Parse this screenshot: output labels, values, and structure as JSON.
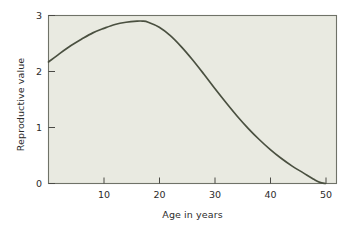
{
  "figure": {
    "page_background": "#ffffff",
    "plot_background": "#e9eae1",
    "frame_color": "#6f7268",
    "text_color": "#2b2b2b",
    "curve_color": "#4a5040"
  },
  "chart_data": {
    "type": "line",
    "title": "",
    "xlabel": "Age in years",
    "ylabel": "Reproductive value",
    "xlim": [
      0,
      52
    ],
    "ylim": [
      0,
      3
    ],
    "grid": false,
    "legend": null,
    "xticks": [
      10,
      20,
      30,
      40,
      50
    ],
    "xtick_labels": [
      "10",
      "20",
      "30",
      "40",
      "50"
    ],
    "yticks": [
      0,
      1,
      2,
      3
    ],
    "ytick_labels": [
      "0",
      "1",
      "2",
      "3"
    ],
    "series": [
      {
        "name": "Reproductive value",
        "color": "#4a5040",
        "x": [
          0,
          2,
          4,
          6,
          8,
          10,
          12,
          14,
          16,
          17,
          18,
          20,
          22,
          24,
          26,
          28,
          30,
          32,
          34,
          36,
          38,
          40,
          42,
          44,
          46,
          48,
          49,
          50
        ],
        "y": [
          2.17,
          2.32,
          2.46,
          2.58,
          2.69,
          2.77,
          2.84,
          2.88,
          2.9,
          2.9,
          2.88,
          2.79,
          2.64,
          2.44,
          2.21,
          1.96,
          1.7,
          1.45,
          1.21,
          0.99,
          0.79,
          0.61,
          0.45,
          0.31,
          0.19,
          0.07,
          0.02,
          0.0
        ]
      }
    ],
    "annotations": []
  }
}
